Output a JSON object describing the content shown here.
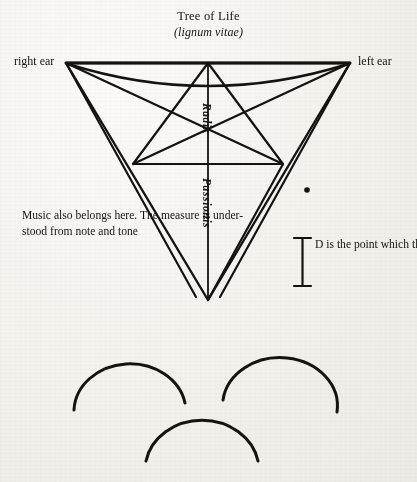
{
  "page": {
    "background_color": "#f3f1ec",
    "ink_color": "#15120f"
  },
  "diagram": {
    "title": "Tree of Life",
    "subtitle": "(lignum vitae)",
    "labels": {
      "right_ear": "right ear",
      "left_ear": "left ear",
      "radix": "Radix",
      "passionis": "Passionis"
    },
    "annotations": {
      "music_note": "Music also belongs here. The measure is under-\nstood from note and tone",
      "d_note": "D is the point which the measurer or measure is called"
    },
    "point_marker": "D",
    "figure_type": "inverted-triangle-monochord"
  }
}
